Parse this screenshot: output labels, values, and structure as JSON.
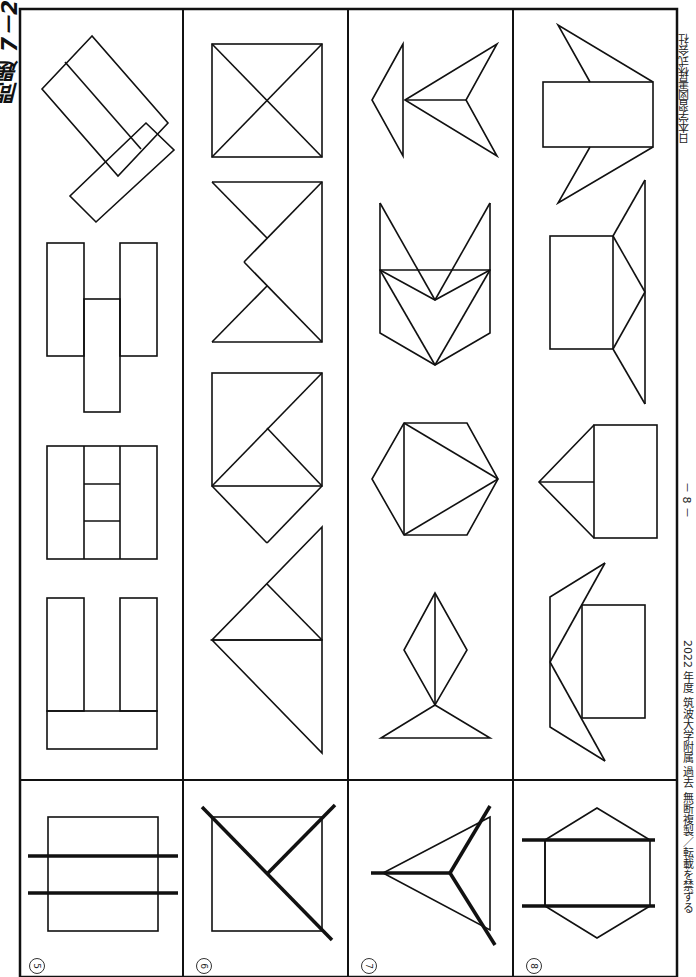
{
  "page": {
    "title": "問題 7－2",
    "page_number": "－ 8 －",
    "footer_left": "2022 年度 筑波大学附属 過去 無断複製／転載を禁ずる",
    "footer_right": "日本学習図書株式会社"
  },
  "problems": [
    {
      "number": "⑤",
      "label": "5",
      "example": "square-with-two-parallel-cut-lines",
      "choices": [
        "rotated-L-of-three-rectangles",
        "H-shape-three-rectangles",
        "square-split-three-strips-middle-divided-in-three",
        "U-shape-three-rectangles"
      ]
    },
    {
      "number": "⑥",
      "label": "6",
      "example": "square-with-diagonal-and-half-diagonal-cut",
      "choices": [
        "square-with-both-diagonals",
        "square-with-notched-triangles",
        "square-with-diagonal-and-diamond-below",
        "two-triangles-stacked"
      ]
    },
    {
      "number": "⑦",
      "label": "7",
      "example": "triangle-cut-from-center-to-vertices",
      "choices": [
        "arrow-of-triangles",
        "chevron-of-triangles",
        "hexagon-with-inscribed-triangle",
        "kite-on-triangle"
      ]
    },
    {
      "number": "⑧",
      "label": "8",
      "example": "hexagon-with-two-parallel-cut-lines",
      "choices": [
        "rectangle-with-two-spikes",
        "rectangle-with-triangle-roof",
        "rectangle-with-side-triangle",
        "rectangle-with-folded-wings"
      ]
    }
  ],
  "colors": {
    "ink": "#111111",
    "paper": "#ffffff"
  }
}
